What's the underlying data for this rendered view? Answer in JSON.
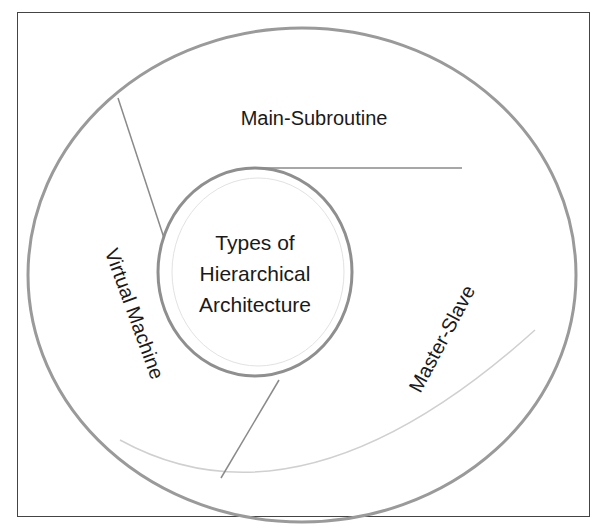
{
  "diagram": {
    "center": {
      "lines": [
        "Types of",
        "Hierarchical",
        "Architecture"
      ]
    },
    "segments": [
      {
        "label": "Main-Subroutine"
      },
      {
        "label": "Master-Slave"
      },
      {
        "label": "Virtual Machine"
      }
    ],
    "colors": {
      "ring": "#9a9a9a",
      "frame": "#444444",
      "text": "#1a1a1a",
      "background": "#ffffff"
    }
  }
}
